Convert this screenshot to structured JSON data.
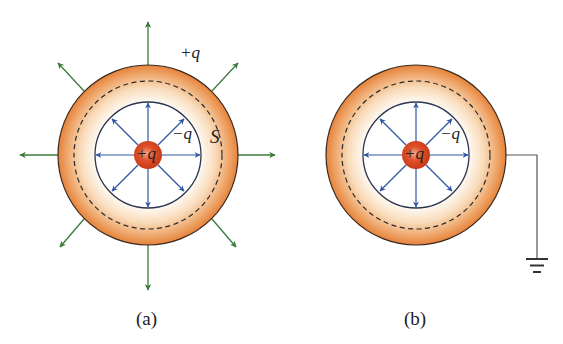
{
  "figures": [
    {
      "id": "a",
      "caption": "(a)",
      "center": [
        148,
        155
      ],
      "inner_charge_label": "+q",
      "inner_surface_label": "−q",
      "outer_surface_label": "+q",
      "gaussian_surface_label": "S",
      "grounded": false,
      "external_field": true
    },
    {
      "id": "b",
      "caption": "(b)",
      "center": [
        416,
        155
      ],
      "inner_charge_label": "+q",
      "inner_surface_label": "−q",
      "grounded": true,
      "external_field": false
    }
  ],
  "colors": {
    "shell_outer": "#e8893a",
    "shell_inner": "#fdf1e4",
    "charge": "#d9401c",
    "inner_field": "#2f56a5",
    "outer_field": "#3c7a3a",
    "line": "#333333"
  }
}
